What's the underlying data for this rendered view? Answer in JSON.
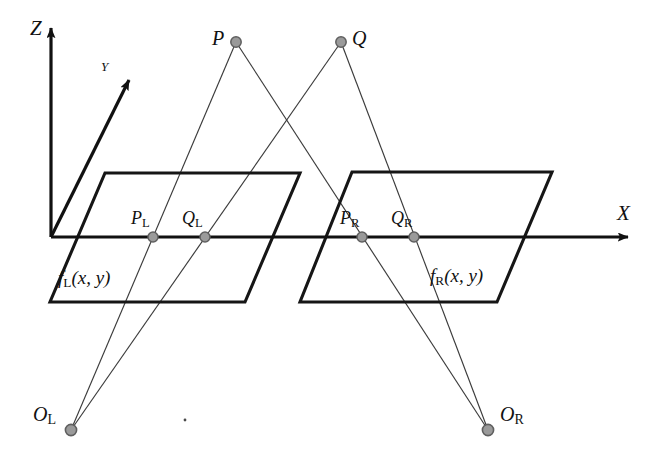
{
  "figure": {
    "background_color": "#ffffff",
    "line_color": "#1a1a1a",
    "ray_color": "#3b3b3b",
    "marker_fill": "#9a9a9a",
    "marker_stroke": "#5f5f5f",
    "width": 661,
    "height": 460
  },
  "axes": {
    "z": {
      "label": "Z",
      "x": 30,
      "y": 20
    },
    "y": {
      "label": "Y",
      "x": 101,
      "y": 62
    },
    "x": {
      "label": "X",
      "x": 617,
      "y": 205
    },
    "origin": {
      "x": 51,
      "y": 237
    }
  },
  "scene_points": [
    {
      "name": "P",
      "label": "P",
      "sub": "",
      "cx": 236,
      "cy": 42,
      "label_x": 212,
      "label_y": 29
    },
    {
      "name": "Q",
      "label": "Q",
      "sub": "",
      "cx": 341,
      "cy": 42,
      "label_x": 352,
      "label_y": 29
    }
  ],
  "image_points": [
    {
      "name": "P_L",
      "label": "P",
      "sub": "L",
      "cx": 153,
      "cy": 237,
      "label_x": 131,
      "label_y": 211
    },
    {
      "name": "Q_L",
      "label": "Q",
      "sub": "L",
      "cx": 205,
      "cy": 237,
      "label_x": 182,
      "label_y": 211
    },
    {
      "name": "P_R",
      "label": "P",
      "sub": "R",
      "cx": 362,
      "cy": 237,
      "label_x": 340,
      "label_y": 211
    },
    {
      "name": "Q_R",
      "label": "Q",
      "sub": "R",
      "cx": 414,
      "cy": 237,
      "label_x": 391,
      "label_y": 211
    }
  ],
  "camera_centers": [
    {
      "name": "O_L",
      "label": "O",
      "sub": "L",
      "cx": 71,
      "cy": 430,
      "label_x": 33,
      "label_y": 406
    },
    {
      "name": "O_R",
      "label": "O",
      "sub": "R",
      "cx": 488,
      "cy": 430,
      "label_x": 500,
      "label_y": 406
    }
  ],
  "image_planes": [
    {
      "name": "left-image-plane",
      "label_main": "f",
      "label_sub": "L",
      "label_tail": "(x, y)",
      "label_x": 58,
      "label_y": 270,
      "corners": "105,173 300,173 245,302 50,302"
    },
    {
      "name": "right-image-plane",
      "label_main": "f",
      "label_sub": "R",
      "label_tail": "(x, y)",
      "label_x": 430,
      "label_y": 268,
      "corners": "352,172 552,172 497,302 300,302"
    }
  ],
  "projection_rays": [
    {
      "name": "ray-P-to-OL",
      "from": "P",
      "to": "O_L",
      "x1": 236,
      "y1": 42,
      "x2": 71,
      "y2": 430
    },
    {
      "name": "ray-P-to-OR",
      "from": "P",
      "to": "O_R",
      "x1": 236,
      "y1": 42,
      "x2": 488,
      "y2": 430
    },
    {
      "name": "ray-Q-to-OL",
      "from": "Q",
      "to": "O_L",
      "x1": 341,
      "y1": 42,
      "x2": 71,
      "y2": 430
    },
    {
      "name": "ray-Q-to-OR",
      "from": "Q",
      "to": "O_R",
      "x1": 341,
      "y1": 42,
      "x2": 488,
      "y2": 430
    }
  ],
  "speck": {
    "name": "stray-speck",
    "cx": 185,
    "cy": 420,
    "r": 1.4
  }
}
